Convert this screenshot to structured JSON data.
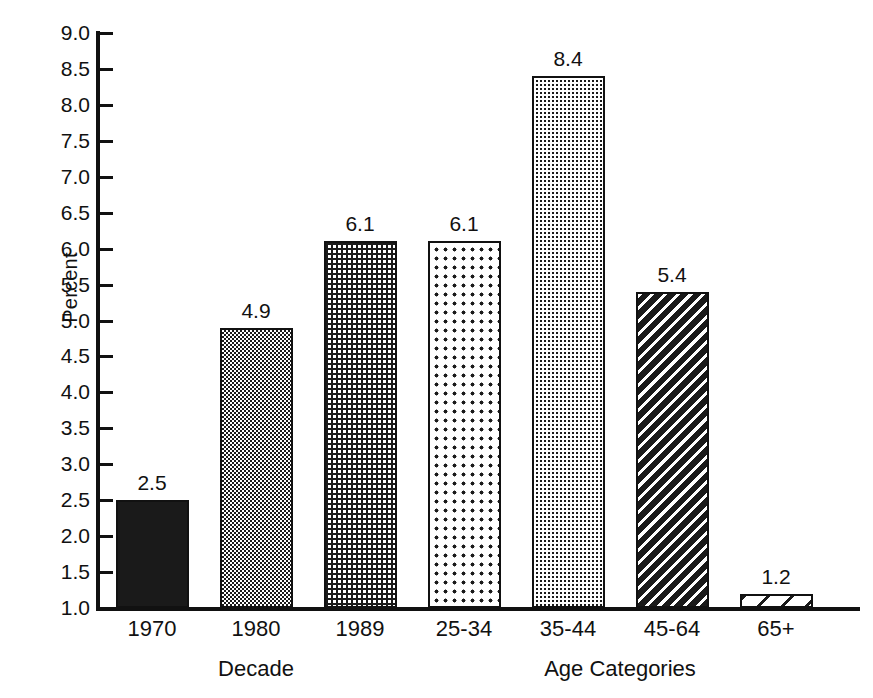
{
  "chart_data": {
    "type": "bar",
    "title": "",
    "xlabel": "",
    "ylabel": "Percent",
    "ylim": [
      1.0,
      9.0
    ],
    "ytick_step": 0.5,
    "grid": false,
    "legend": "none",
    "categories": [
      "1970",
      "1980",
      "1989",
      "25-34",
      "35-44",
      "45-64",
      "65+"
    ],
    "values": [
      2.5,
      4.9,
      6.1,
      6.1,
      8.4,
      5.4,
      1.2
    ],
    "value_labels": [
      "2.5",
      "4.9",
      "6.1",
      "6.1",
      "8.4",
      "5.4",
      "1.2"
    ],
    "ytick_labels": [
      "9.0",
      "8.5",
      "8.0",
      "7.5",
      "7.0",
      "6.5",
      "6.0",
      "5.5",
      "5.0",
      "4.5",
      "4.0",
      "3.5",
      "3.0",
      "2.5",
      "2.0",
      "1.5",
      "1.0"
    ],
    "ytick_values": [
      9.0,
      8.5,
      8.0,
      7.5,
      7.0,
      6.5,
      6.0,
      5.5,
      5.0,
      4.5,
      4.0,
      3.5,
      3.0,
      2.5,
      2.0,
      1.5,
      1.0
    ],
    "bar_patterns": [
      "solid-black",
      "checkerboard",
      "dark-with-white-dots",
      "white-with-sparse-black-dots",
      "white-with-fine-black-dots",
      "dense-black-diagonal-hatch",
      "sparse-black-diagonal-hatch"
    ],
    "groups": [
      {
        "label": "Decade",
        "categories": [
          "1970",
          "1980",
          "1989"
        ]
      },
      {
        "label": "Age Categories",
        "categories": [
          "25-34",
          "35-44",
          "45-64",
          "65+"
        ]
      }
    ],
    "colors": {
      "foreground": "#1a1a1a",
      "background": "#ffffff",
      "axis": "#111111"
    }
  },
  "axis": {
    "y_label": "Percent"
  },
  "groups": {
    "decade": "Decade",
    "age_categories": "Age Categories"
  }
}
